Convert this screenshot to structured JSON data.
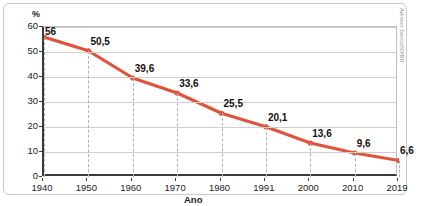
{
  "chart_data": {
    "type": "line",
    "title": "",
    "xlabel": "Ano",
    "ylabel": "%",
    "categories": [
      "1940",
      "1950",
      "1960",
      "1970",
      "1980",
      "1991",
      "2000",
      "2010",
      "2019"
    ],
    "values": [
      56,
      50.5,
      39.6,
      33.6,
      25.5,
      20.1,
      13.6,
      9.6,
      6.6
    ],
    "point_labels": [
      "56",
      "50,5",
      "39,6",
      "33,6",
      "25,5",
      "20,1",
      "13,6",
      "9,6",
      "6,6"
    ],
    "ylim": [
      0,
      60
    ],
    "yticks": [
      0,
      10,
      20,
      30,
      40,
      50,
      60
    ],
    "ytick_labels": [
      "0",
      "10",
      "20",
      "30",
      "40",
      "50",
      "60"
    ],
    "grid": "horizontal-solid-vertical-dashed",
    "legend": "none",
    "series_color": "#e0533c",
    "marker": "circle"
  },
  "credit": {
    "text": "Adilson Secco/ID/BR"
  },
  "caption": {
    "text": ""
  }
}
